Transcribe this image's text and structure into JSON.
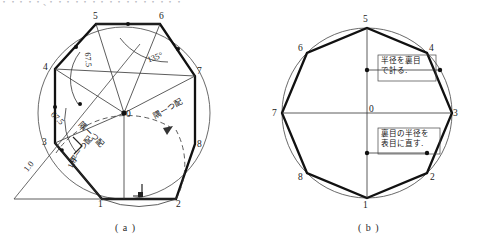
{
  "page": {
    "clipped_top_text": "・・・・・、・・・・・・・・・・・・・・・・",
    "width": 477,
    "height": 247,
    "ink_color": "#111111",
    "thin_color": "#555555"
  },
  "figure_a": {
    "caption": "( a )",
    "vertex_labels": [
      "0",
      "1",
      "2",
      "3",
      "4",
      "5",
      "6",
      "7",
      "8"
    ],
    "annotations": {
      "angle_135": "135°",
      "angle_675_upper": "67.5",
      "angle_675_lower": "67.5",
      "arc_note_left": "隅ーつ配",
      "arc_note_right": "隅ーつ配",
      "arc_note_bottom": "平ーつ配",
      "dim_left": "1.0",
      "dim_inner": "1.0"
    }
  },
  "figure_b": {
    "caption": "( b )",
    "vertex_labels": [
      "0",
      "1",
      "2",
      "3",
      "4",
      "5",
      "6",
      "7",
      "8"
    ],
    "callouts": [
      {
        "name": "upper",
        "line1": "半径を裏目",
        "line2": "で計る."
      },
      {
        "name": "lower",
        "line1": "裏目の半径を",
        "line2": "表目に直す."
      }
    ]
  }
}
